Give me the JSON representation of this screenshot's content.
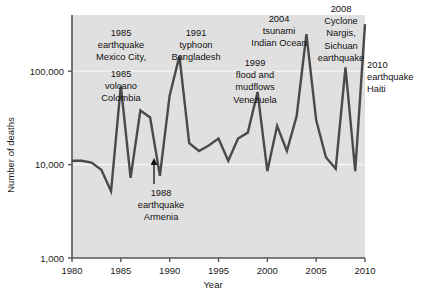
{
  "chart_data": {
    "type": "line",
    "title": "",
    "xlabel": "Year",
    "ylabel": "Number of deaths",
    "yscale": "log",
    "ylim": [
      1000,
      400000
    ],
    "xlim": [
      1980,
      2010
    ],
    "grid": true,
    "legend_position": "none",
    "ytick_labels": [
      "1,000",
      "10,000",
      "100,000"
    ],
    "ytick_values": [
      1000,
      10000,
      100000
    ],
    "xtick_labels": [
      "1980",
      "1985",
      "1990",
      "1995",
      "2000",
      "2005",
      "2010"
    ],
    "xtick_values": [
      1980,
      1985,
      1990,
      1995,
      2000,
      2005,
      2010
    ],
    "x": [
      1980,
      1981,
      1982,
      1983,
      1984,
      1985,
      1986,
      1987,
      1988,
      1989,
      1990,
      1991,
      1992,
      1993,
      1994,
      1995,
      1996,
      1997,
      1998,
      1999,
      2000,
      2001,
      2002,
      2003,
      2004,
      2005,
      2006,
      2007,
      2008,
      2009,
      2010
    ],
    "values": [
      11000,
      11000,
      10500,
      8800,
      5200,
      70000,
      7200,
      38000,
      32000,
      7600,
      55000,
      145000,
      17000,
      14000,
      16000,
      19000,
      11000,
      19000,
      22000,
      60000,
      8500,
      26000,
      14000,
      33000,
      250000,
      30000,
      12000,
      9000,
      110000,
      8500,
      320000
    ],
    "series_color": "#4a4a4a",
    "plot_bg": "#e0e0e0",
    "gridline_color": "#f2f2f2",
    "annotations": [
      {
        "id": "a1985-eq",
        "lines": [
          "1985",
          "earthquake",
          "Mexico City,"
        ],
        "align": "center",
        "x": 121,
        "y": 36
      },
      {
        "id": "a1985-volcano",
        "lines": [
          "1985",
          "volcano",
          "Colombia"
        ],
        "align": "center",
        "x": 121,
        "y": 77
      },
      {
        "id": "a1991",
        "lines": [
          "1991",
          "typhoon",
          "Bangladesh"
        ],
        "align": "center",
        "x": 196,
        "y": 36
      },
      {
        "id": "a1988",
        "lines": [
          "1988",
          "earthquake",
          "Armenia"
        ],
        "align": "center",
        "x": 161,
        "y": 196
      },
      {
        "id": "a1999",
        "lines": [
          "1999",
          "flood and",
          "mudflows",
          "Venezuela"
        ],
        "align": "center",
        "x": 255,
        "y": 66
      },
      {
        "id": "a2004",
        "lines": [
          "2004",
          "tsunami",
          "Indian Ocean"
        ],
        "align": "center",
        "x": 279,
        "y": 22
      },
      {
        "id": "a2008",
        "lines": [
          "2008",
          "Cyclone",
          "Nargis,",
          "Sichuan",
          "earthquake"
        ],
        "align": "center",
        "x": 341,
        "y": 12
      },
      {
        "id": "a2010",
        "lines": [
          "2010",
          "earthquake",
          "Haiti"
        ],
        "align": "left",
        "x": 367,
        "y": 68
      }
    ],
    "arrow_annotation": {
      "id": "arrow-1988",
      "x": 154,
      "y_tail": 184,
      "y_head": 158
    }
  }
}
